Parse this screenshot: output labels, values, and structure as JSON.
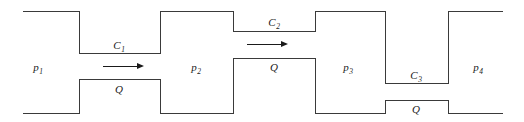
{
  "figure": {
    "type": "fluid-network-schematic",
    "width": 524,
    "height": 122,
    "background_color": "#ffffff",
    "line_color": "#3a3a3a",
    "line_width": 1,
    "text_color": "#1a1a1a"
  },
  "labels": {
    "p1": "p",
    "p1_sub": "1",
    "p2": "p",
    "p2_sub": "2",
    "p3": "p",
    "p3_sub": "3",
    "p4": "p",
    "p4_sub": "4",
    "c1": "C",
    "c1_sub": "1",
    "c2": "C",
    "c2_sub": "2",
    "c3": "C",
    "c3_sub": "3",
    "q1": "Q",
    "q2": "Q",
    "q3": "Q"
  },
  "chambers": [
    {
      "name": "p1",
      "label": "p",
      "subscript": "1",
      "label_x": 38,
      "label_y": 67,
      "x_left": 23,
      "x_right": 79,
      "y_top": 11,
      "y_bottom": 113,
      "open_left": true
    },
    {
      "name": "p2",
      "label": "p",
      "subscript": "2",
      "label_x": 196,
      "label_y": 67,
      "x_left": 160,
      "x_right": 233,
      "y_top": 11,
      "y_bottom": 113,
      "open_left": false
    },
    {
      "name": "p3",
      "label": "p",
      "subscript": "3",
      "label_x": 348,
      "label_y": 67,
      "x_left": 315,
      "x_right": 385,
      "y_top": 11,
      "y_bottom": 113,
      "open_left": false
    },
    {
      "name": "p4",
      "label": "p",
      "subscript": "4",
      "label_x": 478,
      "label_y": 67,
      "x_left": 448,
      "x_right": 503,
      "y_top": 11,
      "y_bottom": 113,
      "open_right": true
    }
  ],
  "channels": [
    {
      "name": "c1",
      "conductance_label": "C",
      "conductance_subscript": "1",
      "flow_label": "Q",
      "x_start": 79,
      "x_end": 160,
      "y_top": 53,
      "y_bottom": 79,
      "conductance_label_x": 119,
      "conductance_label_y": 45,
      "flow_label_x": 119,
      "flow_label_y": 88,
      "arrow_x_start": 103,
      "arrow_x_end": 144,
      "arrow_y": 66
    },
    {
      "name": "c2",
      "conductance_label": "C",
      "conductance_subscript": "2",
      "flow_label": "Q",
      "x_start": 233,
      "x_end": 315,
      "y_top": 31,
      "y_bottom": 58,
      "conductance_label_x": 274,
      "conductance_label_y": 22,
      "flow_label_x": 274,
      "flow_label_y": 67,
      "arrow_x_start": 247,
      "arrow_x_end": 288,
      "arrow_y": 44
    },
    {
      "name": "c3",
      "conductance_label": "C",
      "conductance_subscript": "3",
      "flow_label": "Q",
      "x_start": 385,
      "x_end": 448,
      "y_top": 83,
      "y_bottom": 100,
      "conductance_label_x": 416,
      "conductance_label_y": 75,
      "flow_label_x": 416,
      "flow_label_y": 109,
      "arrow_x_start": 0,
      "arrow_x_end": 0,
      "arrow_y": 0
    }
  ],
  "arrows": [
    {
      "name": "flow-arrow-1",
      "x1": 103,
      "x2": 144,
      "y": 66,
      "direction": "right"
    },
    {
      "name": "flow-arrow-2",
      "x1": 247,
      "x2": 288,
      "y": 44,
      "direction": "right"
    }
  ]
}
